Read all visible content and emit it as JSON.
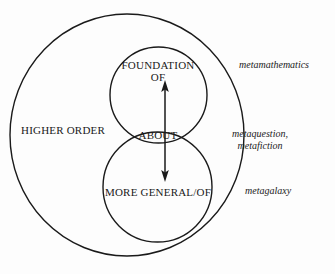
{
  "figure": {
    "type": "euler-venn-diagram",
    "background_color": "#fdfdfd",
    "stroke_color": "#1a1a1a",
    "text_color": "#1a1a1a"
  },
  "regions": {
    "outer_label": "HIGHER ORDER",
    "upper_circle_label_line1": "FOUNDATION",
    "upper_circle_label_line2": "OF",
    "intersection_label": "ABOUT",
    "lower_circle_label": "MORE GENERAL/OF"
  },
  "annotations": {
    "top_right": "metamathematics",
    "middle_right_line1": "metaquestion,",
    "middle_right_line2": "metafiction",
    "bottom_right": "metagalaxy"
  },
  "arrow": {
    "name": "double-headed-vertical-arrow",
    "direction": "both",
    "top_tip_y": 82,
    "bottom_tip_y": 180
  }
}
